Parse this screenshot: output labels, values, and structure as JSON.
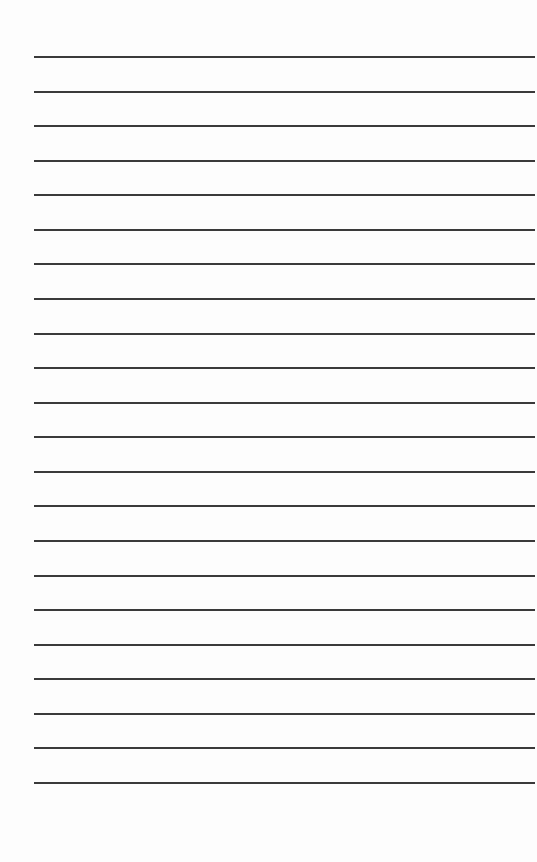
{
  "page": {
    "type": "lined-paper",
    "line_count": 22,
    "first_line_y": 56,
    "line_spacing": 34.57,
    "line_color": "#3a3a3a",
    "background_color": "#fdfdfd"
  }
}
